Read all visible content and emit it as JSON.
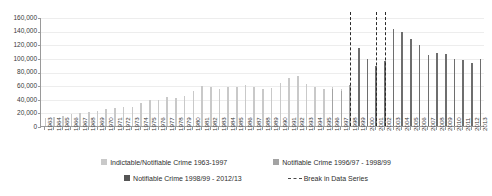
{
  "chart_data": {
    "type": "bar",
    "title": "",
    "xlabel": "",
    "ylabel": "",
    "ylim": [
      0,
      160000
    ],
    "ytick_step": 20000,
    "ytick_labels": [
      "160,000",
      "140,000",
      "120,000",
      "100,000",
      "80,000",
      "60,000",
      "40,000",
      "20,000",
      "0"
    ],
    "ytick_values": [
      160000,
      140000,
      120000,
      100000,
      80000,
      60000,
      40000,
      20000,
      0
    ],
    "grid": true,
    "legend_position": "bottom",
    "categories": [
      "1963",
      "1964",
      "1965",
      "1966",
      "1967",
      "1968",
      "1969",
      "1970",
      "1971",
      "1972",
      "1973",
      "1974",
      "1975",
      "1976",
      "1977",
      "1978",
      "1979",
      "1980",
      "1981",
      "1982",
      "1983",
      "1984",
      "1985",
      "1986",
      "1987",
      "1988",
      "1989",
      "1990",
      "1991",
      "1992",
      "1993",
      "1994",
      "1995",
      "1996",
      "1997",
      "1998",
      "1999",
      "2000",
      "2001",
      "2002",
      "2003",
      "2004",
      "2005",
      "2006",
      "2007",
      "2008",
      "2009",
      "2010",
      "2011",
      "2012",
      "2013"
    ],
    "series": [
      {
        "name": "Indictable/Notifiable Crime 1963-1997",
        "color": "#c9c9c9",
        "values": [
          12000,
          13500,
          15000,
          17000,
          19500,
          20500,
          22000,
          24500,
          26000,
          28500,
          27500,
          33500,
          38000,
          38500,
          42500,
          41500,
          43500,
          51000,
          58500,
          57000,
          55000,
          58000,
          57000,
          60500,
          57000,
          54500,
          56500,
          63000,
          71000,
          73500,
          62000,
          58000,
          54000,
          57500,
          54000,
          null,
          null,
          null,
          null,
          null,
          null,
          null,
          null,
          null,
          null,
          null,
          null,
          null,
          null,
          null,
          null
        ]
      },
      {
        "name": "Notifiable Crime 1996/97 - 1998/99",
        "color": "#a3a3a3",
        "values": [
          null,
          null,
          null,
          null,
          null,
          null,
          null,
          null,
          null,
          null,
          null,
          null,
          null,
          null,
          null,
          null,
          null,
          null,
          null,
          null,
          null,
          null,
          null,
          null,
          null,
          null,
          null,
          null,
          null,
          null,
          null,
          null,
          null,
          55000,
          51000,
          59500,
          null,
          null,
          null,
          null,
          null,
          null,
          null,
          null,
          null,
          null,
          null,
          null,
          null,
          null,
          null
        ]
      },
      {
        "name": "Notifiable Crime 1998/99 - 2012/13",
        "color": "#6e6e6e",
        "values": [
          null,
          null,
          null,
          null,
          null,
          null,
          null,
          null,
          null,
          null,
          null,
          null,
          null,
          null,
          null,
          null,
          null,
          null,
          null,
          null,
          null,
          null,
          null,
          null,
          null,
          null,
          null,
          null,
          null,
          null,
          null,
          null,
          null,
          null,
          null,
          null,
          115000,
          98000,
          88500,
          95000,
          143000,
          138500,
          127500,
          119000,
          104500,
          106500,
          105000,
          98500,
          96500,
          92500,
          99000
        ]
      }
    ],
    "annotations": [
      {
        "label": "Break in Data Series",
        "at_category": "1998"
      },
      {
        "label": "Break in Data Series",
        "at_category": "2001"
      },
      {
        "label": "Break in Data Series",
        "at_category": "2002"
      }
    ]
  },
  "legend": {
    "items": [
      {
        "label": "Indictable/Notifiable Crime 1963-1997",
        "swatch": "s1"
      },
      {
        "label": "Notifiable Crime 1996/97 - 1998/99",
        "swatch": "s2"
      },
      {
        "label": "Notifiable Crime 1998/99 - 2012/13",
        "swatch": "s3"
      },
      {
        "label": "Break in Data Series",
        "swatch": "dash"
      }
    ]
  }
}
